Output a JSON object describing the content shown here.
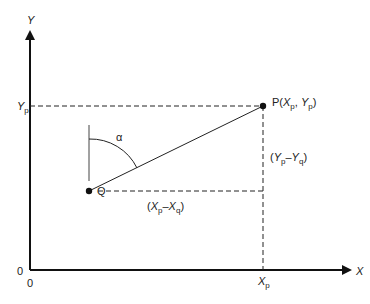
{
  "diagram": {
    "axes": {
      "x_label": "X",
      "y_label": "Y",
      "origin_x": "0",
      "origin_y": "0"
    },
    "point_p": {
      "name": "P",
      "label": "P(",
      "x": "X",
      "x_sub": "p",
      "sep": ", ",
      "y": "Y",
      "y_sub": "p",
      "close": ")"
    },
    "point_q": {
      "name": "Q"
    },
    "angle": {
      "label": "α"
    },
    "tick_y": {
      "main": "Y",
      "sub": "p"
    },
    "tick_x": {
      "main": "X",
      "sub": "p"
    },
    "dy_label": {
      "open": "(",
      "a": "Y",
      "a_sub": "p",
      "minus": "–",
      "b": "Y",
      "b_sub": "q",
      "close": ")"
    },
    "dx_label": {
      "open": "(",
      "a": "X",
      "a_sub": "p",
      "minus": "–",
      "b": "X",
      "b_sub": "q",
      "close": ")"
    }
  }
}
